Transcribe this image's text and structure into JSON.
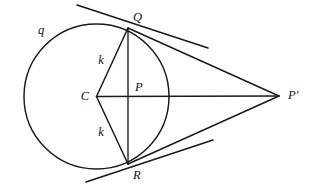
{
  "figure": {
    "background_color": "#ffffff",
    "stroke_color": "#1a1a1a",
    "width": 311,
    "height": 188
  },
  "geometry": {
    "circle": {
      "name": "q",
      "center_label": "C",
      "center": {
        "x": 96.5,
        "y": 96.5
      },
      "radius": 72.5
    },
    "points": {
      "C": {
        "x": 96.5,
        "y": 96.5
      },
      "P": {
        "x": 128,
        "y": 96.5
      },
      "Q": {
        "x": 128,
        "y": 28
      },
      "R": {
        "x": 128,
        "y": 164
      },
      "Pprime": {
        "x": 279,
        "y": 96
      }
    },
    "radii_label": "k"
  },
  "labels": {
    "circle": "q",
    "center": "C",
    "chord_midpoint": "P",
    "tangent_point_top": "Q",
    "tangent_point_bottom": "R",
    "external_point": "P′",
    "radius_top": "k",
    "radius_bottom": "k"
  },
  "label_positions": {
    "circle": {
      "x": 41,
      "y": 31
    },
    "center": {
      "x": 85,
      "y": 97
    },
    "chord_midpoint": {
      "x": 135,
      "y": 88
    },
    "tangent_point_top": {
      "x": 133,
      "y": 18
    },
    "tangent_point_bottom": {
      "x": 133,
      "y": 176
    },
    "external_point": {
      "x": 288,
      "y": 96
    },
    "radius_top": {
      "x": 101,
      "y": 61
    },
    "radius_bottom": {
      "x": 101,
      "y": 133
    }
  },
  "segments": [
    {
      "name": "radius-c-q",
      "label": "k",
      "from": "C",
      "to": "Q"
    },
    {
      "name": "radius-c-r",
      "label": "k",
      "from": "C",
      "to": "R"
    },
    {
      "name": "chord-q-r",
      "label": "",
      "from": "Q",
      "to": "R"
    },
    {
      "name": "axis-c-pprime",
      "label": "",
      "from": "C",
      "to": "P′"
    },
    {
      "name": "tangent-q-pprime",
      "label": "",
      "from": "Q",
      "to": "P′"
    },
    {
      "name": "tangent-r-pprime",
      "label": "",
      "from": "R",
      "to": "P′"
    }
  ],
  "tangent_lines": [
    {
      "name": "tangent-line-at-q",
      "through": "Q",
      "x1": 77,
      "y1": 5,
      "x2": 208,
      "y2": 48
    },
    {
      "name": "tangent-line-at-r",
      "through": "R",
      "x1": 86,
      "y1": 182,
      "x2": 213,
      "y2": 140
    }
  ]
}
